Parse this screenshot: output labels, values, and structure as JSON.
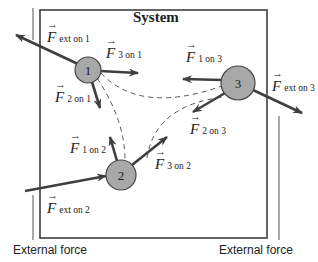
{
  "title": "System",
  "colors": {
    "arrow": "#3f3f3f",
    "particle_fill": "#a8a8a8",
    "box": "#3f3f3f"
  },
  "particles": [
    {
      "id": "1",
      "label": "1"
    },
    {
      "id": "2",
      "label": "2"
    },
    {
      "id": "3",
      "label": "3"
    }
  ],
  "forces": {
    "ext_on_1": {
      "symbol": "F",
      "subscript": "ext on 1"
    },
    "f3_on_1": {
      "symbol": "F",
      "subscript": "3 on 1"
    },
    "f2_on_1": {
      "symbol": "F",
      "subscript": "2 on 1"
    },
    "f1_on_3": {
      "symbol": "F",
      "subscript": "1 on 3"
    },
    "ext_on_3": {
      "symbol": "F",
      "subscript": "ext on 3"
    },
    "f2_on_3": {
      "symbol": "F",
      "subscript": "2 on 3"
    },
    "f1_on_2": {
      "symbol": "F",
      "subscript": "1 on 2"
    },
    "f3_on_2": {
      "symbol": "F",
      "subscript": "3 on 2"
    },
    "ext_on_2": {
      "symbol": "F",
      "subscript": "ext on 2"
    }
  },
  "external_labels": {
    "left": "External force",
    "right": "External force"
  }
}
